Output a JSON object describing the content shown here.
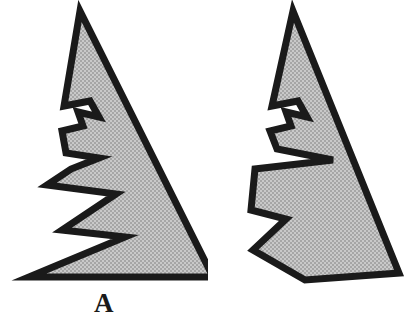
{
  "figure": {
    "background_color": "#ffffff",
    "outline_color": "#1a1a1a",
    "fill_color": "#b9b9b9",
    "fill_pattern": "halftone-dither-gray",
    "caption_a": "A",
    "caption_b": "B",
    "shape_a_name": "jagged-triangle-pointed-base",
    "shape_b_name": "jagged-triangle-blunt-base"
  },
  "chart_data": {
    "type": "scatter",
    "title": "",
    "xlabel": "",
    "ylabel": "",
    "grid": false,
    "legend_position": "none",
    "annotations": [
      "A",
      "B"
    ],
    "shapes": [
      {
        "name": "A",
        "label": "A",
        "description": "Jagged fir-tree-like triangle with sharp pointed lower-left tip",
        "fill": "#b9b9b9",
        "stroke": "#1a1a1a",
        "stroke_width": 7,
        "points": [
          [
            60,
            8
          ],
          [
            166,
            238
          ],
          [
            16,
            238
          ],
          [
            75,
            196
          ],
          [
            35,
            193
          ],
          [
            58,
            167
          ],
          [
            22,
            160
          ],
          [
            60,
            127
          ],
          [
            35,
            126
          ],
          [
            38,
            108
          ],
          [
            57,
            104
          ],
          [
            60,
            113
          ],
          [
            73,
            104
          ],
          [
            70,
            123
          ],
          [
            85,
            125
          ],
          [
            62,
            144
          ],
          [
            81,
            147
          ],
          [
            41,
            177
          ],
          [
            92,
            180
          ],
          [
            60,
            211
          ],
          [
            140,
            229
          ],
          [
            50,
            54
          ],
          [
            42,
            77
          ],
          [
            68,
            75
          ],
          [
            59,
            62
          ],
          [
            74,
            70
          ],
          [
            69,
            83
          ],
          [
            47,
            89
          ]
        ],
        "path": "M60,8 L108,112 L166,238 L16,238 L92,180 L41,177 L81,147 L62,144 L85,125 L70,123 L73,104 L60,113 L57,104 L38,108 L35,126 L60,127 L22,160 L58,167 L35,193 L75,196 L60,211 L140,229 Z"
      },
      {
        "name": "B",
        "label": "B",
        "description": "Jagged fir-tree-like triangle with blunt wide base and notched lower-left",
        "fill": "#b9b9b9",
        "stroke": "#1a1a1a",
        "stroke_width": 7,
        "points": [
          [
            77,
            8
          ],
          [
            190,
            235
          ],
          [
            55,
            235
          ],
          [
            30,
            200
          ],
          [
            60,
            185
          ],
          [
            30,
            176
          ],
          [
            28,
            135
          ],
          [
            90,
            130
          ],
          [
            55,
            110
          ],
          [
            30,
            100
          ],
          [
            38,
            80
          ],
          [
            60,
            80
          ],
          [
            62,
            90
          ],
          [
            76,
            80
          ]
        ],
        "path": "M77,8 L190,235 L55,235 L30,200 L60,185 L30,176 L28,135 L90,130 L55,110 L30,100 L38,80 L60,80 L62,90 L76,80 Z"
      }
    ]
  }
}
